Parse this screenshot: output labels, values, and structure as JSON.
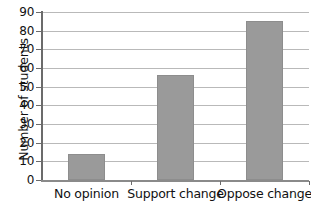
{
  "chart_data": {
    "type": "bar",
    "title": "",
    "xlabel": "",
    "ylabel": "Number of students",
    "categories": [
      "No opinion",
      "Support change",
      "Oppose change"
    ],
    "values": [
      14,
      56,
      85
    ],
    "ylim": [
      0,
      90
    ],
    "ytick_step": 10,
    "yticks": [
      0,
      10,
      20,
      30,
      40,
      50,
      60,
      70,
      80,
      90
    ],
    "ytick_labels": [
      "0",
      "10",
      "20",
      "30",
      "40",
      "50",
      "60",
      "70",
      "80",
      "90"
    ],
    "grid": true,
    "grid_axis": "y",
    "legend": false,
    "legend_position": "none",
    "bar_color": "#9a9a9a",
    "bar_edge_color": "#8d8d8d",
    "gridline_color": "#b9b9b9",
    "axis_color": "#6b6b6b",
    "text_color": "#111111",
    "background_color": "#ffffff"
  }
}
